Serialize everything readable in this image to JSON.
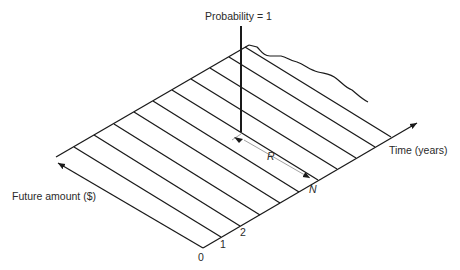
{
  "diagram": {
    "type": "probability-distribution-3d",
    "labels": {
      "probability": "Probability = 1",
      "time_axis": "Time (years)",
      "amount_axis": "Future amount ($)",
      "R": "R",
      "N": "N",
      "tick_0": "0",
      "tick_1": "1",
      "tick_2": "2"
    },
    "colors": {
      "line": "#1a1a1a",
      "dimension": "#888888",
      "text": "#2a2a2a"
    }
  }
}
